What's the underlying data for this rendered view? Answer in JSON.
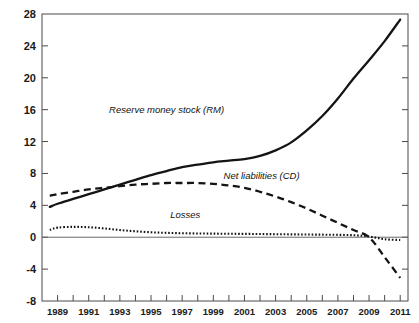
{
  "chart_data": {
    "type": "line",
    "title": "",
    "subtitle": "",
    "xlabel": "",
    "ylabel": "",
    "grid": false,
    "legend_position": "inline-annotations",
    "xlim": [
      1988,
      2011.5
    ],
    "ylim": [
      -8,
      28
    ],
    "ytick_labels": [
      "28",
      "24",
      "20",
      "16",
      "12",
      "8",
      "4",
      "0",
      "-4",
      "-8"
    ],
    "ytick_values": [
      28,
      24,
      20,
      16,
      12,
      8,
      4,
      0,
      -4,
      -8
    ],
    "xtick_labels": [
      "1989",
      "1991",
      "1993",
      "1995",
      "1997",
      "1999",
      "2001",
      "2003",
      "2005",
      "2007",
      "2009",
      "2011"
    ],
    "xtick_values": [
      1989,
      1991,
      1993,
      1995,
      1997,
      1999,
      2001,
      2003,
      2005,
      2007,
      2009,
      2011
    ],
    "xtick_minor_values": [
      1988,
      1990,
      1992,
      1994,
      1996,
      1998,
      2000,
      2002,
      2004,
      2006,
      2008,
      2010
    ],
    "x": [
      1988.5,
      1989,
      1990,
      1991,
      1992,
      1993,
      1994,
      1995,
      1996,
      1997,
      1998,
      1999,
      2000,
      2001,
      2002,
      2003,
      2004,
      2005,
      2006,
      2007,
      2008,
      2009,
      2010,
      2011
    ],
    "series": [
      {
        "name": "Reserve money stock (RM)",
        "style": "solid",
        "color": "#141414",
        "label_x": 1996.0,
        "label_y": 15.6,
        "values": [
          3.8,
          4.2,
          4.8,
          5.4,
          6.0,
          6.6,
          7.2,
          7.8,
          8.3,
          8.8,
          9.1,
          9.4,
          9.6,
          9.8,
          10.2,
          10.9,
          11.9,
          13.4,
          15.2,
          17.4,
          19.9,
          22.2,
          24.6,
          27.3
        ]
      },
      {
        "name": "Net liabilities (CD)",
        "style": "dashed",
        "color": "#141414",
        "label_x": 2002.1,
        "label_y": 7.3,
        "values": [
          5.2,
          5.4,
          5.7,
          6.0,
          6.2,
          6.4,
          6.6,
          6.7,
          6.8,
          6.8,
          6.8,
          6.7,
          6.5,
          6.2,
          5.7,
          5.1,
          4.4,
          3.6,
          2.7,
          1.8,
          0.9,
          0.0,
          -2.5,
          -5.1
        ]
      },
      {
        "name": "Losses",
        "style": "dotted",
        "color": "#141414",
        "label_x": 1997.2,
        "label_y": 2.4,
        "values": [
          0.9,
          1.2,
          1.3,
          1.25,
          1.1,
          0.9,
          0.75,
          0.62,
          0.55,
          0.5,
          0.47,
          0.45,
          0.43,
          0.42,
          0.4,
          0.38,
          0.36,
          0.34,
          0.32,
          0.3,
          0.25,
          0.1,
          -0.25,
          -0.35
        ]
      }
    ],
    "annotations": [
      {
        "text": "Reserve money stock (RM)"
      },
      {
        "text": "Net liabilities (CD)"
      },
      {
        "text": "Losses"
      }
    ],
    "colors": {
      "axis": "#4a4a4a",
      "zero_line": "#6a6a6a",
      "ink": "#141414",
      "background": "#ffffff"
    }
  }
}
